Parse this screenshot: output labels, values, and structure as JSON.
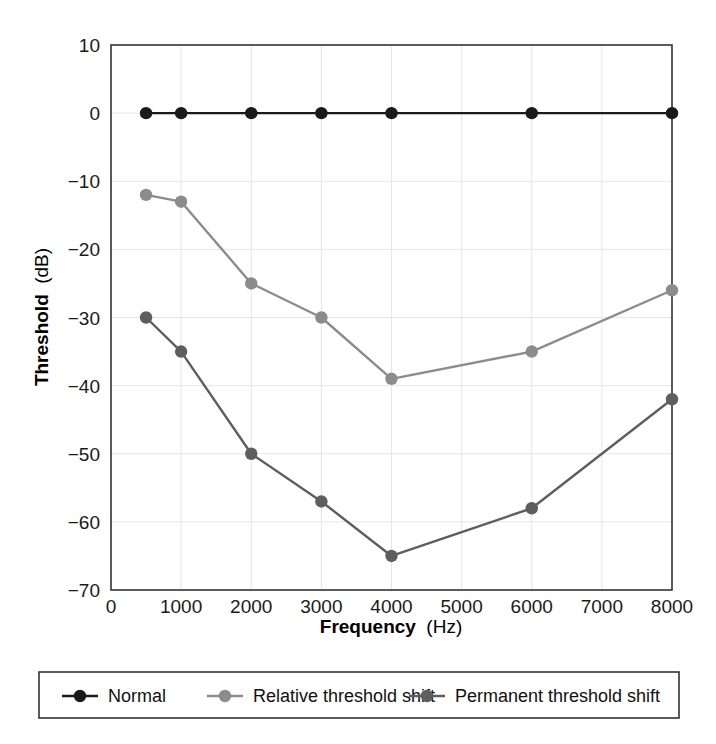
{
  "chart_data": {
    "type": "line",
    "title": "",
    "subtitle": "",
    "xlabel_bold": "Frequency",
    "xlabel_unit": "(Hz)",
    "ylabel_bold": "Threshold",
    "ylabel_unit": "(dB)",
    "x": [
      500,
      1000,
      2000,
      3000,
      4000,
      6000,
      8000
    ],
    "xlim": [
      0,
      8000
    ],
    "ylim": [
      -70,
      10
    ],
    "xticks": [
      0,
      1000,
      2000,
      3000,
      4000,
      5000,
      6000,
      7000,
      8000
    ],
    "xticklabels": [
      "0",
      "1000",
      "2000",
      "3000",
      "4000",
      "5000",
      "6000",
      "7000",
      "8000"
    ],
    "yticks": [
      10,
      0,
      -10,
      -20,
      -30,
      -40,
      -50,
      -60,
      -70
    ],
    "yticklabels": [
      "10",
      "0",
      "−10",
      "−20",
      "−30",
      "−40",
      "−50",
      "−60",
      "−70"
    ],
    "grid": true,
    "legend_position": "below-outside",
    "series": [
      {
        "name": "Normal",
        "color": "#1a1a1a",
        "marker": "circle",
        "values": [
          0,
          0,
          0,
          0,
          0,
          0,
          0
        ]
      },
      {
        "name": "Relative threshold shift",
        "color": "#8c8c8c",
        "marker": "circle",
        "values": [
          -12,
          -13,
          -25,
          -30,
          -39,
          -35,
          -26
        ]
      },
      {
        "name": "Permanent threshold shift",
        "color": "#5e5e5e",
        "marker": "circle",
        "values": [
          -30,
          -35,
          -50,
          -57,
          -65,
          -58,
          -42
        ]
      }
    ]
  },
  "legend": {
    "items": [
      {
        "label": "Normal",
        "color": "#1a1a1a"
      },
      {
        "label": "Relative threshold shift",
        "color": "#8c8c8c"
      },
      {
        "label": "Permanent threshold shift",
        "color": "#5e5e5e"
      }
    ]
  },
  "style": {
    "axis_color": "#333333",
    "grid_color": "#e6e6e6",
    "background": "#ffffff",
    "legend_border": "#333333"
  }
}
